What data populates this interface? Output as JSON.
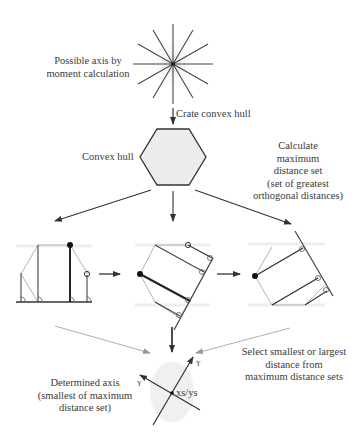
{
  "diagram": {
    "nodes": {
      "possible_axis": {
        "lines": [
          "Possible axis by",
          "moment calculation"
        ]
      },
      "create_hull": {
        "label": "Crate convex hull"
      },
      "convex_hull": {
        "label": "Convex hull"
      },
      "calc_max": {
        "lines": [
          "Calculate",
          "maximum",
          "distance set",
          "(set of greatest",
          "orthogonal distances)"
        ]
      },
      "select": {
        "lines": [
          "Select smallest or largest",
          "distance from",
          "maximum distance sets"
        ]
      },
      "determined": {
        "lines": [
          "Determined axis",
          "(smallest of maximum",
          "distance set)"
        ]
      },
      "centroid": {
        "label": "xs/ys"
      }
    },
    "colors": {
      "line": "#333333",
      "faint": "#bbbbbb",
      "hull_fill": "#ececec"
    }
  }
}
